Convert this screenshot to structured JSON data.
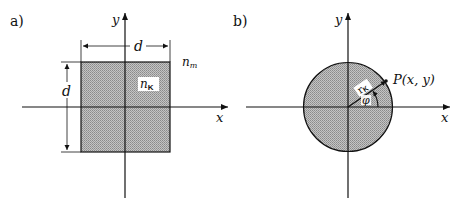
{
  "panel_a": {
    "label": "a)",
    "x_axis_label": "x",
    "y_axis_label": "y",
    "width_dimension": "d",
    "height_dimension": "d",
    "core_index_label": "n",
    "core_index_sub": "K",
    "cladding_index_label": "n",
    "cladding_index_sub": "m"
  },
  "panel_b": {
    "label": "b)",
    "x_axis_label": "x",
    "y_axis_label": "y",
    "radius_label": "r",
    "radius_sub": "K",
    "angle_label": "φ",
    "point_label": "P(x, y)"
  },
  "colors": {
    "fill": "#b8b8b8",
    "stroke": "#111111",
    "background": "#ffffff"
  }
}
